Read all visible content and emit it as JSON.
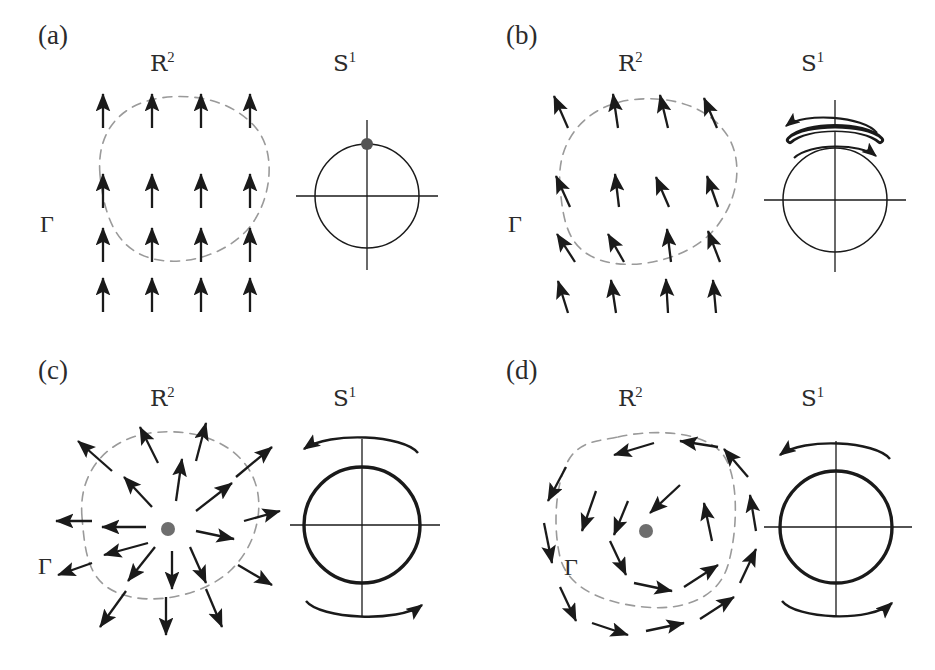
{
  "figure": {
    "background_color": "#ffffff",
    "ink_color": "#1a1a1a",
    "dash_color": "#9a9a9a",
    "dot_color": "#6e6e6e"
  },
  "panels": [
    {
      "id": "a",
      "label": "(a)",
      "domain_label_base": "R",
      "domain_label_sup": "2",
      "circle_label_base": "S",
      "circle_label_sup": "1",
      "curve_label": "Γ",
      "field_type": "uniform",
      "winding_number": 0,
      "circle_marker": "point-at-top",
      "circle_stroke_weight": "thin",
      "has_singularity": false,
      "arc_arrows": []
    },
    {
      "id": "b",
      "label": "(b)",
      "domain_label_base": "R",
      "domain_label_sup": "2",
      "circle_label_base": "S",
      "circle_label_sup": "1",
      "curve_label": "Γ",
      "field_type": "perturbed-uniform",
      "winding_number": 0,
      "circle_marker": "ribbon-arc-top",
      "circle_stroke_weight": "thin",
      "has_singularity": false,
      "arc_arrows": [
        "left-above",
        "right-below"
      ]
    },
    {
      "id": "c",
      "label": "(c)",
      "domain_label_base": "R",
      "domain_label_sup": "2",
      "circle_label_base": "S",
      "circle_label_sup": "1",
      "curve_label": "Γ",
      "field_type": "radial-source",
      "winding_number": 1,
      "circle_marker": "full-bold-circle",
      "circle_stroke_weight": "bold",
      "has_singularity": true,
      "arc_arrows": [
        "left-above",
        "right-below"
      ]
    },
    {
      "id": "d",
      "label": "(d)",
      "domain_label_base": "R",
      "domain_label_sup": "2",
      "circle_label_base": "S",
      "circle_label_sup": "1",
      "curve_label": "Γ",
      "field_type": "rotational-vortex",
      "winding_number": 1,
      "circle_marker": "full-bold-circle",
      "circle_stroke_weight": "bold",
      "has_singularity": true,
      "arc_arrows": [
        "left-above",
        "right-below"
      ]
    }
  ]
}
